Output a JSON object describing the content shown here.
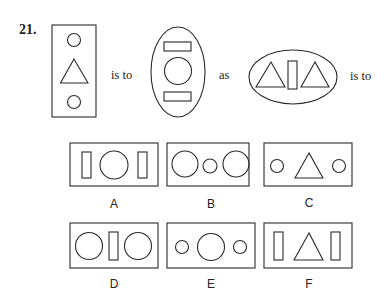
{
  "question": {
    "number": "21.",
    "connector_1": "is to",
    "connector_2": "as",
    "connector_3": "is to",
    "stem": [
      {
        "id": "figure-1",
        "container": "rectangle",
        "contents": [
          "small-circle",
          "triangle",
          "small-circle"
        ],
        "orientation": "vertical"
      },
      {
        "id": "figure-2",
        "container": "ellipse",
        "contents": [
          "rectangle",
          "circle",
          "rectangle"
        ],
        "orientation": "vertical"
      },
      {
        "id": "figure-3",
        "container": "ellipse",
        "contents": [
          "triangle",
          "rectangle",
          "triangle"
        ],
        "orientation": "horizontal"
      }
    ]
  },
  "options": [
    {
      "label": "A",
      "contents": [
        "rectangle",
        "circle",
        "rectangle"
      ]
    },
    {
      "label": "B",
      "contents": [
        "circle",
        "small-circle",
        "circle"
      ]
    },
    {
      "label": "C",
      "contents": [
        "small-circle",
        "triangle",
        "small-circle"
      ]
    },
    {
      "label": "D",
      "contents": [
        "circle",
        "rectangle",
        "circle"
      ]
    },
    {
      "label": "E",
      "contents": [
        "small-circle",
        "circle",
        "small-circle"
      ]
    },
    {
      "label": "F",
      "contents": [
        "rectangle",
        "triangle",
        "rectangle"
      ]
    }
  ],
  "colors": {
    "stroke": "#2a2a2a",
    "background": "#ffffff",
    "text": "#222222"
  }
}
